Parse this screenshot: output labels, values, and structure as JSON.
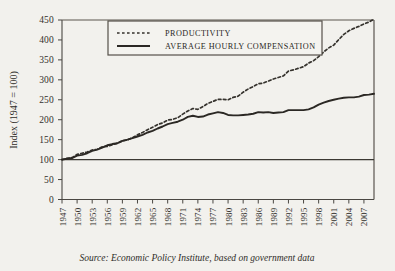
{
  "chart_data": {
    "type": "line",
    "title": "",
    "xlabel": "",
    "ylabel": "Index (1947 = 100)",
    "ylim": [
      0,
      450
    ],
    "xlim": [
      1947,
      2009
    ],
    "grid": false,
    "legend_position": "top-center",
    "ytick_labels": [
      "0",
      "50",
      "100",
      "150",
      "200",
      "250",
      "300",
      "350",
      "400",
      "450"
    ],
    "ytick_values": [
      0,
      50,
      100,
      150,
      200,
      250,
      300,
      350,
      400,
      450
    ],
    "xtick_labels": [
      "1947",
      "1950",
      "1953",
      "1956",
      "1959",
      "1962",
      "1965",
      "1968",
      "1971",
      "1974",
      "1977",
      "1980",
      "1983",
      "1986",
      "1989",
      "1992",
      "1995",
      "1998",
      "2001",
      "2004",
      "2007"
    ],
    "xtick_values": [
      1947,
      1950,
      1953,
      1956,
      1959,
      1962,
      1965,
      1968,
      1971,
      1974,
      1977,
      1980,
      1983,
      1986,
      1989,
      1992,
      1995,
      1998,
      2001,
      2004,
      2007
    ],
    "reference_line": {
      "value": 100,
      "label": "100 baseline"
    },
    "x": [
      1947,
      1948,
      1949,
      1950,
      1951,
      1952,
      1953,
      1954,
      1955,
      1956,
      1957,
      1958,
      1959,
      1960,
      1961,
      1962,
      1963,
      1964,
      1965,
      1966,
      1967,
      1968,
      1969,
      1970,
      1971,
      1972,
      1973,
      1974,
      1975,
      1976,
      1977,
      1978,
      1979,
      1980,
      1981,
      1982,
      1983,
      1984,
      1985,
      1986,
      1987,
      1988,
      1989,
      1990,
      1991,
      1992,
      1993,
      1994,
      1995,
      1996,
      1997,
      1998,
      1999,
      2000,
      2001,
      2002,
      2003,
      2004,
      2005,
      2006,
      2007,
      2008,
      2009
    ],
    "series": [
      {
        "name": "PRODUCTIVITY",
        "style": "dashed",
        "color": "#35322d",
        "values": [
          100,
          103,
          105,
          113,
          116,
          119,
          124,
          126,
          132,
          133,
          137,
          141,
          147,
          149,
          155,
          162,
          168,
          175,
          181,
          188,
          192,
          199,
          201,
          205,
          214,
          222,
          228,
          226,
          233,
          241,
          246,
          251,
          251,
          250,
          256,
          259,
          269,
          277,
          283,
          290,
          292,
          297,
          302,
          306,
          310,
          322,
          325,
          329,
          333,
          342,
          348,
          358,
          370,
          380,
          387,
          401,
          414,
          423,
          429,
          434,
          440,
          445,
          452
        ]
      },
      {
        "name": "AVERAGE HOURLY COMPENSATION",
        "style": "solid",
        "color": "#2b2824",
        "values": [
          100,
          102,
          104,
          110,
          112,
          116,
          122,
          125,
          130,
          136,
          139,
          141,
          147,
          150,
          154,
          158,
          162,
          168,
          172,
          178,
          183,
          189,
          192,
          195,
          200,
          207,
          210,
          207,
          208,
          213,
          216,
          219,
          217,
          212,
          211,
          211,
          212,
          213,
          215,
          219,
          218,
          219,
          217,
          218,
          219,
          224,
          224,
          224,
          224,
          226,
          231,
          238,
          243,
          247,
          250,
          253,
          255,
          256,
          256,
          258,
          262,
          263,
          265
        ]
      }
    ],
    "caption": "Source: Economic Policy Institute, based on government data"
  },
  "legend": {
    "items": [
      {
        "label": "PRODUCTIVITY",
        "style": "dashed"
      },
      {
        "label": "AVERAGE HOURLY COMPENSATION",
        "style": "solid"
      }
    ]
  },
  "colors": {
    "background": "#f2f1ed",
    "ink": "#2e2c28",
    "frame": "#55514a"
  }
}
